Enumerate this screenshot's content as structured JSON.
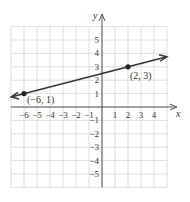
{
  "chart_data": {
    "type": "line",
    "title": "",
    "xlabel": "x",
    "ylabel": "y",
    "xlim": [
      -7,
      5
    ],
    "ylim": [
      -6,
      6
    ],
    "grid": true,
    "x_ticks": [
      "−6",
      "−5",
      "−4",
      "−3",
      "−2",
      "−1",
      "1",
      "2",
      "3",
      "4"
    ],
    "y_ticks": [
      "5",
      "4",
      "3",
      "2",
      "1",
      "−1",
      "−2",
      "−3",
      "−4",
      "−5"
    ],
    "series": [
      {
        "name": "line",
        "x": [
          -7,
          5
        ],
        "y": [
          0.75,
          3.75
        ],
        "arrows": "both"
      }
    ],
    "points": [
      {
        "x": -6,
        "y": 1,
        "label": "(−6, 1)"
      },
      {
        "x": 2,
        "y": 3,
        "label": "(2, 3)"
      }
    ]
  }
}
